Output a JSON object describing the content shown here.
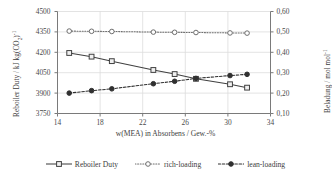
{
  "chart_data": {
    "type": "line",
    "title": "",
    "xlabel": "w(MEA) in Absorbens / Gew.-%",
    "ylabel_left": "Reboiler Duty / kJ kg(CO2)-1",
    "ylabel_right": "Beladung / mol mol-1",
    "x": [
      15.1,
      17.2,
      19.1,
      23.0,
      25.0,
      27.0,
      30.2,
      31.8
    ],
    "xlim": [
      14,
      34
    ],
    "xticks": [
      14,
      18,
      22,
      26,
      30,
      34
    ],
    "xticklabels": [
      "14",
      "18",
      "22",
      "26",
      "30",
      "34"
    ],
    "ylim_left": [
      3750,
      4500
    ],
    "yticks_left": [
      3750,
      3900,
      4050,
      4200,
      4350,
      4500
    ],
    "yticklabels_left": [
      "3750",
      "3900",
      "4050",
      "4200",
      "4350",
      "4500"
    ],
    "ylim_right": [
      0.1,
      0.6
    ],
    "yticks_right": [
      0.1,
      0.2,
      0.3,
      0.4,
      0.5,
      0.6
    ],
    "yticklabels_right": [
      "0,10",
      "0,20",
      "0,30",
      "0,40",
      "0,50",
      "0,60"
    ],
    "grid": true,
    "legend_position": "bottom",
    "series": [
      {
        "name": "Reboiler Duty",
        "axis": "left",
        "marker": "open-square",
        "linestyle": "solid",
        "color": "#404040",
        "values": [
          4195,
          4168,
          4135,
          4070,
          4040,
          4005,
          3965,
          3940
        ]
      },
      {
        "name": "rich-loading",
        "axis": "right",
        "marker": "open-circle",
        "linestyle": "dotted",
        "color": "#6e6e6e",
        "values": [
          0.504,
          0.503,
          0.502,
          0.499,
          0.498,
          0.497,
          0.495,
          0.494
        ]
      },
      {
        "name": "lean-loading",
        "axis": "right",
        "marker": "filled-circle",
        "linestyle": "dashed",
        "color": "#303030",
        "values": [
          0.2,
          0.212,
          0.221,
          0.246,
          0.258,
          0.272,
          0.286,
          0.292
        ]
      }
    ]
  },
  "axes": {
    "left_title_parts": {
      "main": "Reboiler Duty / kJ kg(CO",
      "sub": "2",
      "tail": ")",
      "sup": "-1"
    },
    "right_title_parts": {
      "main": "Beladung / mol mol",
      "sup": "-1"
    },
    "x_title": "w(MEA) in Absorbens / Gew.-%"
  },
  "legend": {
    "items": [
      {
        "label": "Reboiler Duty"
      },
      {
        "label": "rich-loading"
      },
      {
        "label": "lean-loading"
      }
    ]
  },
  "colors": {
    "axis": "#7a7a7a",
    "grid": "#dcdcdc",
    "text": "#3d3d3d",
    "series_reboiler": "#404040",
    "series_rich": "#6e6e6e",
    "series_lean": "#303030"
  }
}
